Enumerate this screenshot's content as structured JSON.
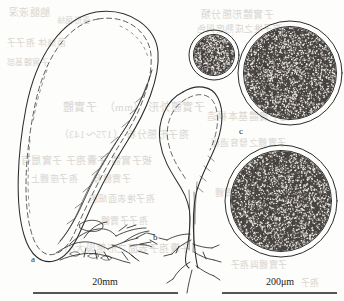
{
  "figure": {
    "kind": "scientific-line-drawing",
    "background_color": "#fdfdfb",
    "ink_color": "#2b2b2b",
    "panel_labels": [
      {
        "id": "a",
        "text": "a",
        "x": 31,
        "y": 254,
        "describes": "large elongated ovoid fruiting body with basal rhizomorphs"
      },
      {
        "id": "b",
        "text": "b",
        "x": 153,
        "y": 232,
        "describes": "pear-shaped stalked fruiting body with roots"
      },
      {
        "id": "c",
        "text": "c",
        "x": 239,
        "y": 126,
        "describes": "stippled circular spore-mass cross sections"
      }
    ],
    "scale_bars": [
      {
        "id": "scale-left",
        "label": "20mm",
        "label_x": 105,
        "label_y": 276,
        "line_x1": 33,
        "line_x2": 178,
        "line_y": 293,
        "applies_to": "a, b"
      },
      {
        "id": "scale-right",
        "label": "200μm",
        "label_x": 280,
        "label_y": 276,
        "line_x1": 222,
        "line_x2": 337,
        "line_y": 293,
        "applies_to": "c"
      }
    ],
    "spore_circles": [
      {
        "id": "spore-circle-small",
        "cx": 214,
        "cy": 55,
        "r_outer": 25,
        "r_inner": 20,
        "stipple_count": 430
      },
      {
        "id": "spore-circle-upper-large",
        "cx": 290,
        "cy": 73,
        "r_outer": 52,
        "r_inner": 46,
        "stipple_count": 1750
      },
      {
        "id": "spore-circle-lower-large",
        "cx": 281,
        "cy": 201,
        "r_outer": 56,
        "r_inner": 50,
        "stipple_count": 2000
      }
    ],
    "bleed_through_lines": [
      {
        "text": "脑髓液深",
        "x": 8,
        "y": 4,
        "size": 10
      },
      {
        "text": "菌絲体 孢子子",
        "x": 6,
        "y": 36,
        "size": 9
      },
      {
        "text": "子實體基部",
        "x": 6,
        "y": 56,
        "size": 8
      },
      {
        "text": "蛋形菌絲",
        "x": 56,
        "y": 14,
        "size": 8
      },
      {
        "text": "子實體外形 （mm）　子實體",
        "x": 62,
        "y": 98,
        "size": 11
      },
      {
        "text": "孢子形態分析 （175～143）",
        "x": 58,
        "y": 126,
        "size": 10
      },
      {
        "text": "被子實體 子囊孢子 子實層有",
        "x": 20,
        "y": 152,
        "size": 10
      },
      {
        "text": "子實體發 　 孢子座體上",
        "x": 30,
        "y": 172,
        "size": 9
      },
      {
        "text": "孢子堆表面細胞",
        "x": 88,
        "y": 192,
        "size": 9
      },
      {
        "text": "孢子子實體",
        "x": 100,
        "y": 214,
        "size": 9
      },
      {
        "text": "子囊孢子表面之形態與大小",
        "x": 64,
        "y": 240,
        "size": 10
      },
      {
        "text": "子實體形態分類",
        "x": 200,
        "y": 6,
        "size": 10
      },
      {
        "text": "孢子堆之成熟度與色",
        "x": 196,
        "y": 22,
        "size": 9
      },
      {
        "text": "孢子實體基本構造",
        "x": 206,
        "y": 108,
        "size": 10
      },
      {
        "text": "子實體之發育過程",
        "x": 210,
        "y": 136,
        "size": 9
      },
      {
        "text": "孢子堆 子實體",
        "x": 214,
        "y": 186,
        "size": 9
      },
      {
        "text": "子實體與孢子",
        "x": 230,
        "y": 258,
        "size": 9
      },
      {
        "text": "孢子",
        "x": 300,
        "y": 276,
        "size": 9
      }
    ]
  }
}
